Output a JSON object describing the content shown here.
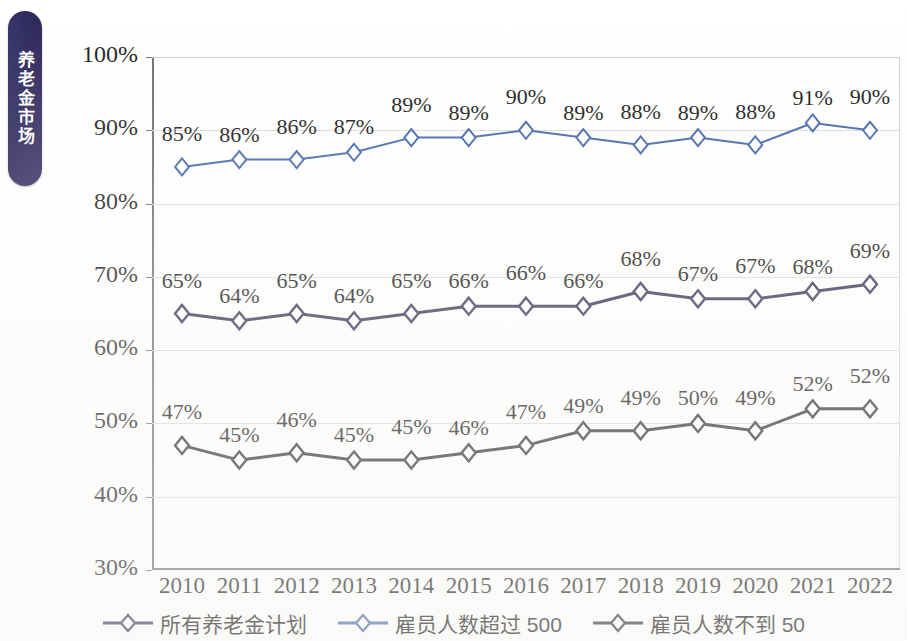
{
  "side_tab": {
    "label": "养老金市场"
  },
  "top_cut_text": "",
  "colors": {
    "tab_background": "#2e2a5e",
    "tab_text": "#ffffff",
    "series_all_plans": "#2f2f52",
    "series_over_500": "#3f63a8",
    "series_under_50": "#2b2b2b",
    "gridline": "#dadada",
    "axis": "#6e6e6e",
    "label_text": "#141414"
  },
  "chart_data": {
    "type": "line",
    "title": "",
    "xlabel": "",
    "ylabel": "",
    "grid": true,
    "legend_position": "bottom",
    "ylim": [
      30,
      100
    ],
    "ytick_labels": [
      "100%",
      "90%",
      "80%",
      "70%",
      "60%",
      "50%",
      "40%",
      "30%"
    ],
    "ytick_values": [
      100,
      90,
      80,
      70,
      60,
      50,
      40,
      30
    ],
    "categories": [
      "2010",
      "2011",
      "2012",
      "2013",
      "2014",
      "2015",
      "2016",
      "2017",
      "2018",
      "2019",
      "2020",
      "2021",
      "2022"
    ],
    "series": [
      {
        "name": "雇员人数超过 500",
        "color": "#3f63a8",
        "marker": "diamond-open",
        "values": [
          85,
          86,
          86,
          87,
          89,
          89,
          90,
          89,
          88,
          89,
          88,
          91,
          90
        ],
        "labels": [
          "85%",
          "86%",
          "86%",
          "87%",
          "89%",
          "89%",
          "90%",
          "89%",
          "88%",
          "89%",
          "88%",
          "91%",
          "90%"
        ]
      },
      {
        "name": "所有养老金计划",
        "color": "#2f2f52",
        "marker": "diamond-open",
        "values": [
          65,
          64,
          65,
          64,
          65,
          66,
          66,
          66,
          68,
          67,
          67,
          68,
          69
        ],
        "labels": [
          "65%",
          "64%",
          "65%",
          "64%",
          "65%",
          "66%",
          "66%",
          "66%",
          "68%",
          "67%",
          "67%",
          "68%",
          "69%"
        ]
      },
      {
        "name": "雇员人数不到 50",
        "color": "#2b2b2b",
        "marker": "diamond-open",
        "values": [
          47,
          45,
          46,
          45,
          45,
          46,
          47,
          49,
          49,
          50,
          49,
          52,
          52
        ],
        "labels": [
          "47%",
          "45%",
          "46%",
          "45%",
          "45%",
          "46%",
          "47%",
          "49%",
          "49%",
          "50%",
          "49%",
          "52%",
          "52%"
        ]
      }
    ]
  },
  "legend": {
    "items": [
      {
        "label": "所有养老金计划",
        "color": "#2f2f52"
      },
      {
        "label": "雇员人数超过 500",
        "color": "#3f63a8"
      },
      {
        "label": "雇员人数不到 50",
        "color": "#2b2b2b"
      }
    ]
  }
}
